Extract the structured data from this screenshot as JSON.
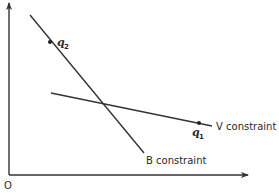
{
  "diagram": {
    "type": "constraint-lines",
    "origin_label": "O",
    "lines": [
      {
        "id": "B",
        "label": "B constraint",
        "from": [
          30,
          15
        ],
        "to": [
          144,
          153
        ]
      },
      {
        "id": "V",
        "label": "V constraint",
        "from": [
          51,
          93
        ],
        "to": [
          212,
          126
        ]
      }
    ],
    "points": [
      {
        "id": "q2",
        "label": "q",
        "subscript": "2",
        "x": 50,
        "y": 42,
        "on_line": "B"
      },
      {
        "id": "q1",
        "label": "q",
        "subscript": "1",
        "x": 199,
        "y": 123,
        "on_line": "V"
      }
    ],
    "colors": {
      "ink": "#333333",
      "background": "#ffffff"
    }
  }
}
